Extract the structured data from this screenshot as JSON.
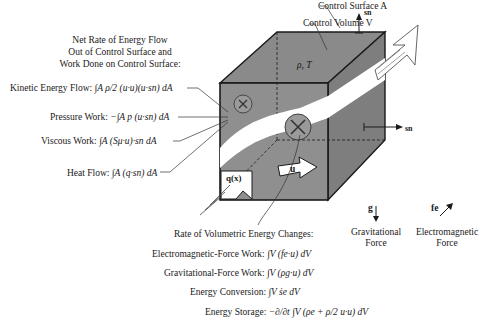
{
  "diagram": {
    "colors": {
      "cube_front": "#8f8f8f",
      "cube_top": "#8a8a8a",
      "cube_side": "#7e7e7e",
      "flow_band": "#ffffff",
      "edge": "#1a1a1a",
      "text": "#1a1a1a"
    },
    "top_labels": {
      "control_surface": "Control Surface A",
      "control_volume": "Control Volume V",
      "sn_top": "sn"
    },
    "cube": {
      "state_label": "ρ, T",
      "sn_side": "sn",
      "velocity_label": "u",
      "heat_flux_label": "q(x)"
    },
    "surface_section": {
      "heading_line1": "Net Rate of Energy Flow",
      "heading_line2": "Out of Control Surface and",
      "heading_line3": "Work Done on Control Surface:",
      "items": [
        {
          "name": "Kinetic Energy Flow:",
          "expr": "∫A ρ/2 (u·u)(u·sn) dA"
        },
        {
          "name": "Pressure Work:",
          "expr": "−∫A p (u·sn) dA"
        },
        {
          "name": "Viscous Work:",
          "expr": "∫A (Sμ·u)·sn dA"
        },
        {
          "name": "Heat Flow:",
          "expr": "∫A (q·sn) dA"
        }
      ]
    },
    "volume_section": {
      "heading": "Rate of Volumetric Energy Changes:",
      "items": [
        {
          "name": "Electromagnetic-Force Work:",
          "expr": "∫V (fe·u) dV"
        },
        {
          "name": "Gravitational-Force Work:",
          "expr": "∫V (ρg·u) dV"
        },
        {
          "name": "Energy Conversion:",
          "expr": "∫V ṡe dV"
        },
        {
          "name": "Energy Storage:",
          "expr": "−∂/∂t ∫V (ρe + ρ/2 u·u) dV"
        }
      ]
    },
    "forces": {
      "gravity_symbol": "g",
      "gravity_line1": "Gravitational",
      "gravity_line2": "Force",
      "em_symbol": "fe",
      "em_line1": "Electromagnetic",
      "em_line2": "Force"
    }
  }
}
